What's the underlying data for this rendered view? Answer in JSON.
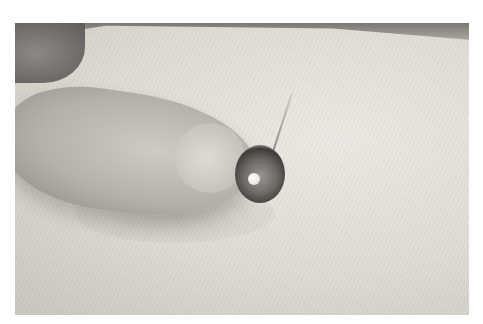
{
  "image": {
    "description": "Close-up photo of a fingertip pressing a metal snap fastener onto white twill fabric while a sewing needle is threaded through it",
    "subjects": [
      "finger",
      "snap-fastener",
      "sewing-needle",
      "twill-fabric"
    ],
    "palette": {
      "fabric": "#dedbd3",
      "finger": "#b4b0aa",
      "snap_metal": "#6e6b68",
      "background_top": "#7a7874",
      "border": "#ffffff"
    }
  }
}
